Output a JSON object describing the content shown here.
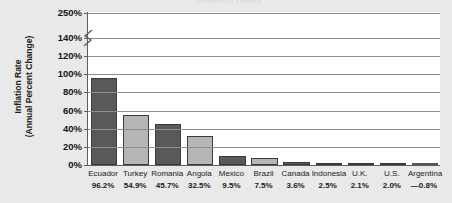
{
  "title_remnant": "Inflation Rates",
  "axis": {
    "ylabel_line1": "Inflation Rate",
    "ylabel_line2": "(Annual Percent Change)",
    "yticks": [
      "250%",
      "140%",
      "120%",
      "100%",
      "80%",
      "60%",
      "40%",
      "20%",
      "0%"
    ],
    "break_between": [
      "140%",
      "250%"
    ]
  },
  "colors": {
    "background": "#e9e9e9",
    "plot_background": "#ffffff",
    "bar_dark": "#595959",
    "bar_light": "#b6b6b6",
    "axis": "#5d5d5d",
    "grid": "#8e8e8e",
    "text": "#1a1a1a"
  },
  "chart_data": {
    "type": "bar",
    "title": "Inflation Rates",
    "xlabel": "",
    "ylabel": "Inflation Rate (Annual Percent Change)",
    "ylim": [
      0,
      140
    ],
    "yticks": [
      0,
      20,
      40,
      60,
      80,
      100,
      120,
      140,
      250
    ],
    "axis_break": {
      "from": 140,
      "to": 250
    },
    "grid": true,
    "legend": "none",
    "categories": [
      "Ecuador",
      "Turkey",
      "Romania",
      "Angola",
      "Mexico",
      "Brazil",
      "Canada",
      "Indonesia",
      "U.K.",
      "U.S.",
      "Argentina"
    ],
    "values": [
      96.2,
      54.9,
      45.7,
      32.5,
      9.5,
      7.5,
      3.6,
      2.5,
      2.1,
      2.0,
      -0.8
    ],
    "value_labels": [
      "96.2%",
      "54.9%",
      "45.7%",
      "32.5%",
      "9.5%",
      "7.5%",
      "3.6%",
      "2.5%",
      "2.1%",
      "2.0%",
      "—0.8%"
    ],
    "bar_shades": [
      "dark",
      "light",
      "dark",
      "light",
      "dark",
      "light",
      "dark",
      "light",
      "dark",
      "light",
      "dark"
    ]
  }
}
